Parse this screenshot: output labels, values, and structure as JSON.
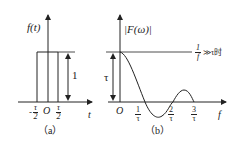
{
  "panel_a": {
    "caption": "（a）",
    "y_label": "f(t)",
    "x_label": "t",
    "origin": "O",
    "left_tick": {
      "sign": "-",
      "num": "τ",
      "den": "2"
    },
    "right_tick": {
      "num": "τ",
      "den": "2"
    },
    "height_label": "1"
  },
  "panel_b": {
    "caption": "（b）",
    "y_label": "|F(ω)|",
    "x_label": "f",
    "origin": "O",
    "height_label": "τ",
    "ticks": [
      {
        "num": "1",
        "den": "τ"
      },
      {
        "num": "2",
        "den": "τ"
      },
      {
        "num": "3",
        "den": "τ"
      }
    ],
    "annotation": {
      "num": "1",
      "den": "f",
      "suffix": "≫τ时"
    }
  }
}
